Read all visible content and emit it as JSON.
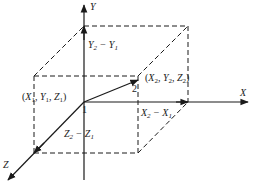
{
  "diagram": {
    "type": "3d-coordinate-box",
    "axes": {
      "x_label": "X",
      "y_label": "Y",
      "z_label": "Z"
    },
    "points": {
      "p1": {
        "number": "1",
        "coords": {
          "open": "(",
          "x": "X",
          "xs": "1",
          "y": "Y",
          "ys": "1",
          "z": "Z",
          "zs": "1",
          "close": ")"
        }
      },
      "p2": {
        "number": "2",
        "coords": {
          "open": "(",
          "x": "X",
          "xs": "2",
          "y": "Y",
          "ys": "2",
          "z": "Z",
          "zs": "2",
          "close": ")"
        }
      }
    },
    "differences": {
      "dy": {
        "a": "Y",
        "as": "2",
        "op": " − ",
        "b": "Y",
        "bs": "1"
      },
      "dx": {
        "a": "X",
        "as": "2",
        "op": " − ",
        "b": "X",
        "bs": "1"
      },
      "dz": {
        "a": "Z",
        "as": "2",
        "op": " − ",
        "b": "Z",
        "bs": "1"
      }
    },
    "line_color": "#1a1a1a"
  }
}
